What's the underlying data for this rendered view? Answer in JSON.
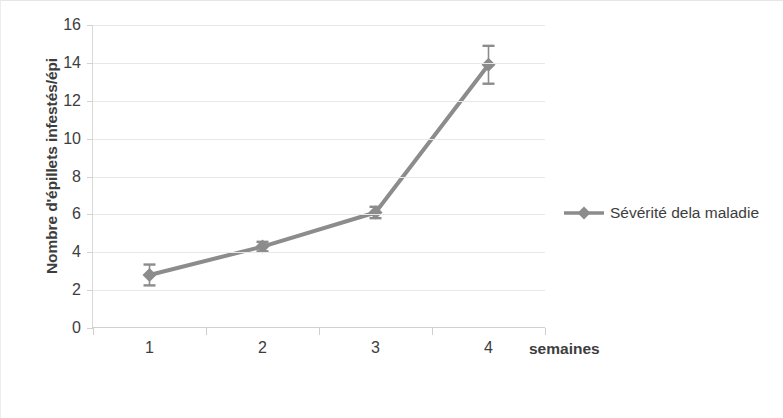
{
  "chart_data": {
    "type": "line",
    "title": "",
    "subtitle": "",
    "xlabel": "semaines",
    "ylabel": "Nombre d'épillets infestés/épi",
    "categories": [
      "1",
      "2",
      "3",
      "4"
    ],
    "x": [
      1,
      2,
      3,
      4
    ],
    "series": [
      {
        "name": "Sévérité dela maladie",
        "values": [
          2.8,
          4.3,
          6.1,
          13.9
        ],
        "errors": [
          0.55,
          0.25,
          0.3,
          1.0
        ],
        "color": "#8c8c8c",
        "marker": "diamond"
      }
    ],
    "ylim": [
      0,
      16
    ],
    "y_ticks": [
      0,
      2,
      4,
      6,
      8,
      10,
      12,
      14,
      16
    ],
    "y_tick_labels": [
      "0",
      "2",
      "4",
      "6",
      "8",
      "10",
      "12",
      "14",
      "16"
    ],
    "grid": "horizontal",
    "legend_position": "right",
    "error_bars": true
  },
  "legend": {
    "entries": [
      {
        "label": "Sévérité dela maladie",
        "color": "#8c8c8c",
        "marker": "diamond"
      }
    ]
  },
  "colors": {
    "series": "#8c8c8c",
    "gridline": "#e8e8e8",
    "axis": "#d0d0d0",
    "text": "#3d3d3d",
    "background": "#ffffff"
  }
}
